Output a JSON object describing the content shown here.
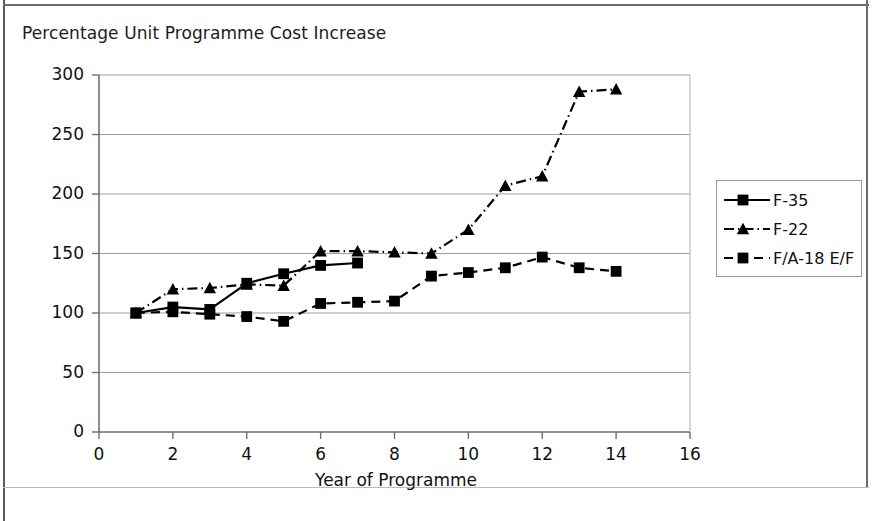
{
  "chart_data": {
    "type": "line",
    "title": "Percentage Unit Programme Cost Increase",
    "xlabel": "Year of Programme",
    "ylabel": "",
    "xlim": [
      0,
      16
    ],
    "ylim": [
      0,
      300
    ],
    "xticks": [
      "0",
      "2",
      "4",
      "6",
      "8",
      "10",
      "12",
      "14",
      "16"
    ],
    "yticks": [
      "0",
      "50",
      "100",
      "150",
      "200",
      "250",
      "300"
    ],
    "grid": "horizontal",
    "legend_position": "right",
    "series": [
      {
        "name": "F-35",
        "marker": "square",
        "line_style": "solid",
        "color": "#000000",
        "x": [
          1,
          2,
          3,
          4,
          5,
          6,
          7
        ],
        "values": [
          100,
          105,
          103,
          125,
          133,
          140,
          142
        ]
      },
      {
        "name": "F-22",
        "marker": "triangle",
        "line_style": "dash-dot",
        "color": "#000000",
        "x": [
          1,
          2,
          3,
          4,
          5,
          6,
          7,
          8,
          9,
          10,
          11,
          12,
          13,
          14
        ],
        "values": [
          100,
          120,
          121,
          124,
          123,
          152,
          152,
          151,
          150,
          170,
          207,
          215,
          286,
          288
        ]
      },
      {
        "name": "F/A-18 E/F",
        "marker": "square",
        "line_style": "dashed",
        "color": "#000000",
        "x": [
          1,
          2,
          3,
          4,
          5,
          6,
          7,
          8,
          9,
          10,
          11,
          12,
          13,
          14
        ],
        "values": [
          100,
          101,
          99,
          97,
          93,
          108,
          109,
          110,
          131,
          134,
          138,
          147,
          138,
          135
        ]
      }
    ]
  },
  "title": {
    "text": "Percentage Unit Programme Cost Increase"
  },
  "axes": {
    "x_title": "Year of Programme",
    "x_labels": [
      "0",
      "2",
      "4",
      "6",
      "8",
      "10",
      "12",
      "14",
      "16"
    ],
    "y_labels": [
      "300",
      "250",
      "200",
      "150",
      "100",
      "50",
      "0"
    ]
  },
  "legend": {
    "entries": [
      {
        "label": "F-35"
      },
      {
        "label": "F-22"
      },
      {
        "label": "F/A-18 E/F"
      }
    ]
  }
}
